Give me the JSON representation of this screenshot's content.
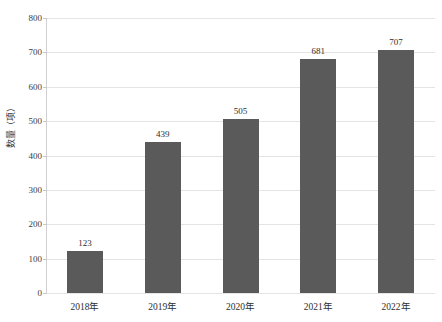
{
  "clipped_header_text": "　　　　　　　　　　　　　　　　　　　　　　",
  "chart_data": {
    "type": "bar",
    "title": "",
    "xlabel": "",
    "ylabel": "数量（项）",
    "categories": [
      "2018年",
      "2019年",
      "2020年",
      "2021年",
      "2022年"
    ],
    "values": [
      123,
      439,
      505,
      681,
      707
    ],
    "value_labels": [
      "123",
      "439",
      "505",
      "681",
      "707"
    ],
    "ylim": [
      0,
      800
    ],
    "ytick_step": 100,
    "ytick_labels": [
      "0",
      "100",
      "200",
      "300",
      "400",
      "500",
      "600",
      "700",
      "800"
    ],
    "grid": "horizontal",
    "legend": "none",
    "bar_color": "#5a5a5a",
    "gridline_color": "#e4e4e6",
    "axis_color": "#d0d0d2",
    "background_color": "#ffffff"
  }
}
